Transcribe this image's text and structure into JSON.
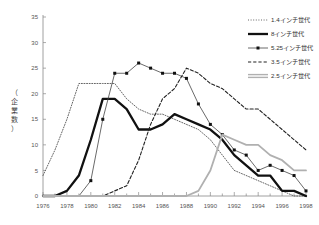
{
  "chart_data": {
    "type": "line",
    "title": "",
    "xlabel": "",
    "ylabel": "（企業数）",
    "xlim": [
      1976,
      1998
    ],
    "ylim": [
      0,
      35
    ],
    "ytick_step": 5,
    "xtick_step": 2,
    "grid": false,
    "legend_position": "top-right",
    "yticks": [
      "0",
      "5",
      "10",
      "15",
      "20",
      "25",
      "30",
      "35"
    ],
    "xticks": [
      "1976",
      "1978",
      "1980",
      "1982",
      "1984",
      "1986",
      "1988",
      "1990",
      "1992",
      "1994",
      "1996",
      "1998"
    ],
    "x": [
      1976,
      1977,
      1978,
      1979,
      1980,
      1981,
      1982,
      1983,
      1984,
      1985,
      1986,
      1987,
      1988,
      1989,
      1990,
      1991,
      1992,
      1993,
      1994,
      1995,
      1996,
      1997,
      1998
    ],
    "series": [
      {
        "name": "1.4インチ世代",
        "style": "dotted",
        "color": "#555555",
        "values": [
          4,
          9,
          15,
          22,
          22,
          22,
          22,
          19,
          17,
          16,
          16,
          15,
          14,
          13,
          11,
          8,
          5,
          4,
          3,
          2,
          1,
          0,
          0
        ]
      },
      {
        "name": "8インチ世代",
        "style": "thick-solid",
        "color": "#111111",
        "values": [
          0,
          0,
          1,
          4,
          11,
          19,
          19,
          17,
          13,
          13,
          14,
          16,
          15,
          14,
          13,
          11,
          8,
          6,
          4,
          4,
          1,
          1,
          0
        ]
      },
      {
        "name": "5.25インチ世代",
        "style": "marker-line",
        "color": "#444444",
        "values": [
          0,
          0,
          0,
          0,
          3,
          15,
          24,
          24,
          26,
          25,
          24,
          24,
          23,
          18,
          14,
          12,
          9,
          8,
          5,
          6,
          5,
          4,
          1
        ]
      },
      {
        "name": "3.5インチ世代",
        "style": "dashed",
        "color": "#222222",
        "values": [
          0,
          0,
          0,
          0,
          0,
          0,
          1,
          2,
          7,
          14,
          19,
          21,
          25,
          24,
          22,
          21,
          19,
          17,
          17,
          15,
          13,
          11,
          9
        ]
      },
      {
        "name": "2.5インチ世代",
        "style": "gray-solid",
        "color": "#b0b0b0",
        "values": [
          0,
          0,
          0,
          0,
          0,
          0,
          0,
          0,
          0,
          0,
          0,
          0,
          0,
          1,
          5,
          12,
          11,
          10,
          10,
          8,
          7,
          5,
          5
        ]
      }
    ]
  },
  "legend": {
    "items": [
      {
        "label": "1.4インチ世代",
        "swatch": "dotted"
      },
      {
        "label": "8インチ世代",
        "swatch": "thick-solid"
      },
      {
        "label": "5.25インチ世代",
        "swatch": "marker-line"
      },
      {
        "label": "3.5インチ世代",
        "swatch": "dashed"
      },
      {
        "label": "2.5インチ世代",
        "swatch": "gray-solid"
      }
    ]
  }
}
